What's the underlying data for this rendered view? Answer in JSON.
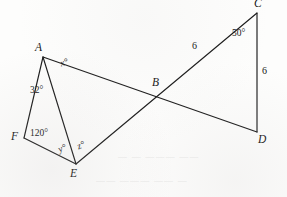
{
  "figure": {
    "width": 287,
    "height": 197,
    "stroke_color": "#1a1a1a",
    "background_color": "#fdfdfc"
  },
  "vertices": [
    {
      "id": "A",
      "label": "A",
      "x": 43,
      "y": 57,
      "label_x": 35,
      "label_y": 42
    },
    {
      "id": "B",
      "label": "B",
      "x": 157,
      "y": 96,
      "label_x": 152,
      "label_y": 77
    },
    {
      "id": "C",
      "label": "C",
      "x": 257,
      "y": 13,
      "label_x": 254,
      "label_y": -2
    },
    {
      "id": "D",
      "label": "D",
      "x": 257,
      "y": 132,
      "label_x": 258,
      "label_y": 134
    },
    {
      "id": "E",
      "label": "E",
      "x": 76,
      "y": 164,
      "label_x": 70,
      "label_y": 168
    },
    {
      "id": "F",
      "label": "F",
      "x": 24,
      "y": 138,
      "label_x": 11,
      "label_y": 131
    }
  ],
  "segments": [
    {
      "name": "segment-A-F",
      "from": "A",
      "to": "F"
    },
    {
      "name": "segment-F-E",
      "from": "F",
      "to": "E"
    },
    {
      "name": "segment-A-E",
      "from": "A",
      "to": "E"
    },
    {
      "name": "segment-A-D",
      "from": "A",
      "to": "D"
    },
    {
      "name": "segment-E-C",
      "from": "E",
      "to": "C"
    },
    {
      "name": "segment-C-D",
      "from": "C",
      "to": "D"
    }
  ],
  "angle_labels": [
    {
      "name": "angle-x",
      "text": "x°",
      "x": 59,
      "y": 60,
      "rotate": -19,
      "italic": true
    },
    {
      "name": "angle-32",
      "text": "32°",
      "x": 30,
      "y": 86,
      "rotate": 0,
      "italic": false
    },
    {
      "name": "angle-120",
      "text": "120°",
      "x": 30,
      "y": 129,
      "rotate": 0,
      "italic": false
    },
    {
      "name": "angle-y",
      "text": "y°",
      "x": 57,
      "y": 146,
      "rotate": -22,
      "italic": true
    },
    {
      "name": "angle-z",
      "text": "z°",
      "x": 76,
      "y": 143,
      "rotate": -22,
      "italic": true
    },
    {
      "name": "angle-50",
      "text": "50°",
      "x": 232,
      "y": 29,
      "rotate": 0,
      "italic": false
    }
  ],
  "side_labels": [
    {
      "name": "side-length-EC",
      "text": "6",
      "x": 192,
      "y": 41
    },
    {
      "name": "side-length-CD",
      "text": "6",
      "x": 262,
      "y": 66
    }
  ],
  "bleed_through": [
    {
      "text": "— —  ———  ——",
      "x": 118,
      "y": 152
    },
    {
      "text": "——  ———  —— —",
      "x": 96,
      "y": 176
    }
  ]
}
